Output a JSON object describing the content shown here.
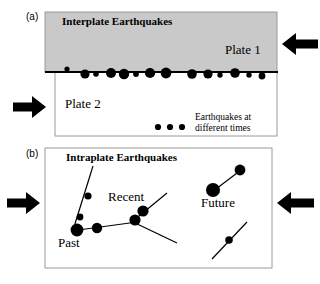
{
  "figure": {
    "width": 320,
    "height": 284,
    "background": "#ffffff",
    "ink_color": "#000000",
    "plate1_fill": "#c9c9c9",
    "box_stroke": "#9a9a9a"
  },
  "panel_a": {
    "tag": "(a)",
    "heading": "Interplate Earthquakes",
    "plate1_label": "Plate 1",
    "plate2_label": "Plate 2",
    "legend_line1": "Earthquakes at",
    "legend_line2": "different times",
    "arrow_top_direction": "left",
    "arrow_bottom_direction": "right",
    "plate1_box": {
      "x": 45,
      "y": 12,
      "w": 232,
      "h": 60
    },
    "plate2_box": {
      "x": 55,
      "y": 72,
      "w": 222,
      "h": 64
    },
    "interface_line": {
      "x1": 45,
      "y1": 72,
      "x2": 278,
      "y2": 72
    },
    "interface_quakes": [
      {
        "cx": 67,
        "cy": 69,
        "r": 2.6
      },
      {
        "cx": 85,
        "cy": 74,
        "r": 4.6
      },
      {
        "cx": 96,
        "cy": 74,
        "r": 2.8
      },
      {
        "cx": 111,
        "cy": 73,
        "r": 5.0
      },
      {
        "cx": 124,
        "cy": 74,
        "r": 5.2
      },
      {
        "cx": 136,
        "cy": 74,
        "r": 2.9
      },
      {
        "cx": 150,
        "cy": 73,
        "r": 5.1
      },
      {
        "cx": 166,
        "cy": 73,
        "r": 5.4
      },
      {
        "cx": 192,
        "cy": 74,
        "r": 4.8
      },
      {
        "cx": 208,
        "cy": 74,
        "r": 4.6
      },
      {
        "cx": 220,
        "cy": 75,
        "r": 2.7
      },
      {
        "cx": 235,
        "cy": 73,
        "r": 4.8
      },
      {
        "cx": 249,
        "cy": 75,
        "r": 2.7
      },
      {
        "cx": 262,
        "cy": 76,
        "r": 3.4
      }
    ],
    "legend_dots": [
      {
        "cx": 158,
        "cy": 127,
        "r": 3.1
      },
      {
        "cx": 170,
        "cy": 127,
        "r": 3.1
      },
      {
        "cx": 182,
        "cy": 127,
        "r": 3.1
      }
    ]
  },
  "panel_b": {
    "tag": "(b)",
    "heading": "Intraplate Earthquakes",
    "past_label": "Past",
    "recent_label": "Recent",
    "future_label": "Future",
    "arrow_left_direction": "right",
    "arrow_right_direction": "left",
    "box": {
      "x": 45,
      "y": 148,
      "w": 227,
      "h": 120
    },
    "faults": [
      {
        "name": "past-upper-fault",
        "x1": 93,
        "y1": 166,
        "x2": 74,
        "y2": 227
      },
      {
        "name": "past-lower-fault",
        "x1": 71,
        "y1": 231,
        "x2": 137,
        "y2": 222
      },
      {
        "name": "recent-fault-main",
        "x1": 133,
        "y1": 221,
        "x2": 167,
        "y2": 193
      },
      {
        "name": "recent-fault-branch",
        "x1": 133,
        "y1": 222,
        "x2": 177,
        "y2": 243
      },
      {
        "name": "future-fault",
        "x1": 212,
        "y1": 192,
        "x2": 241,
        "y2": 170
      },
      {
        "name": "future-minor-fault",
        "x1": 212,
        "y1": 259,
        "x2": 247,
        "y2": 222
      }
    ],
    "quakes": [
      {
        "name": "past-upper-quake-1",
        "cx": 88,
        "cy": 196,
        "r": 3.6
      },
      {
        "name": "past-upper-quake-2",
        "cx": 80,
        "cy": 217,
        "r": 3.4
      },
      {
        "name": "past-quake-large",
        "cx": 77,
        "cy": 230,
        "r": 6.4
      },
      {
        "name": "past-quake-mid",
        "cx": 97,
        "cy": 228,
        "r": 5.2
      },
      {
        "name": "recent-quake-1",
        "cx": 135,
        "cy": 220,
        "r": 5.6
      },
      {
        "name": "recent-quake-2",
        "cx": 143,
        "cy": 211,
        "r": 5.6
      },
      {
        "name": "future-quake-large",
        "cx": 213,
        "cy": 190,
        "r": 7.0
      },
      {
        "name": "future-quake-small",
        "cx": 240,
        "cy": 170,
        "r": 5.4
      },
      {
        "name": "future-minor-quake",
        "cx": 229,
        "cy": 240,
        "r": 3.8
      }
    ]
  }
}
